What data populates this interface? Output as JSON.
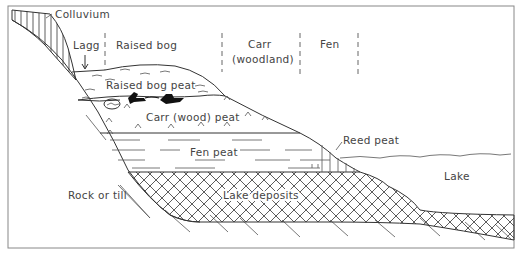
{
  "diagram": {
    "zones": [
      {
        "id": "lagg",
        "label": "Lagg"
      },
      {
        "id": "raised-bog",
        "label": "Raised bog"
      },
      {
        "id": "carr",
        "label": "Carr",
        "sublabel": "(woodland)"
      },
      {
        "id": "fen",
        "label": "Fen"
      }
    ],
    "layers": {
      "colluvium": "Colluvium",
      "raised_bog_peat": "Raised bog peat",
      "carr_peat": "Carr (wood) peat",
      "fen_peat": "Fen peat",
      "reed_peat": "Reed peat",
      "lake_deposits": "Lake deposits",
      "rock": "Rock or till",
      "lake": "Lake"
    },
    "colors": {
      "line": "#333333",
      "text": "#444444",
      "background": "#ffffff",
      "frame": "#888888"
    }
  }
}
